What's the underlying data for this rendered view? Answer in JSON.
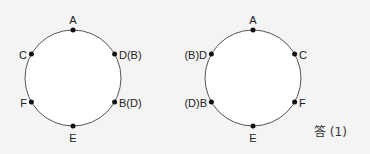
{
  "diagrams": [
    {
      "name": "left-circle",
      "center": [
        73,
        78
      ],
      "radius": 48,
      "points": [
        {
          "label": "A",
          "angle": 90
        },
        {
          "label": "D(B)",
          "angle": 30
        },
        {
          "label": "B(D)",
          "angle": -30
        },
        {
          "label": "E",
          "angle": -90
        },
        {
          "label": "F",
          "angle": -150
        },
        {
          "label": "C",
          "angle": 150
        }
      ]
    },
    {
      "name": "right-circle",
      "center": [
        253,
        78
      ],
      "radius": 48,
      "points": [
        {
          "label": "A",
          "angle": 90
        },
        {
          "label": "C",
          "angle": 30
        },
        {
          "label": "F",
          "angle": -30
        },
        {
          "label": "E",
          "angle": -90
        },
        {
          "label": "(D)B",
          "angle": -150
        },
        {
          "label": "(B)D",
          "angle": 150
        }
      ]
    }
  ],
  "answer_label": "答 (1)",
  "colors": {
    "background": "#f4f4f4",
    "circle_fill": "#ffffff",
    "circle_stroke": "#555555",
    "point": "#111111"
  }
}
